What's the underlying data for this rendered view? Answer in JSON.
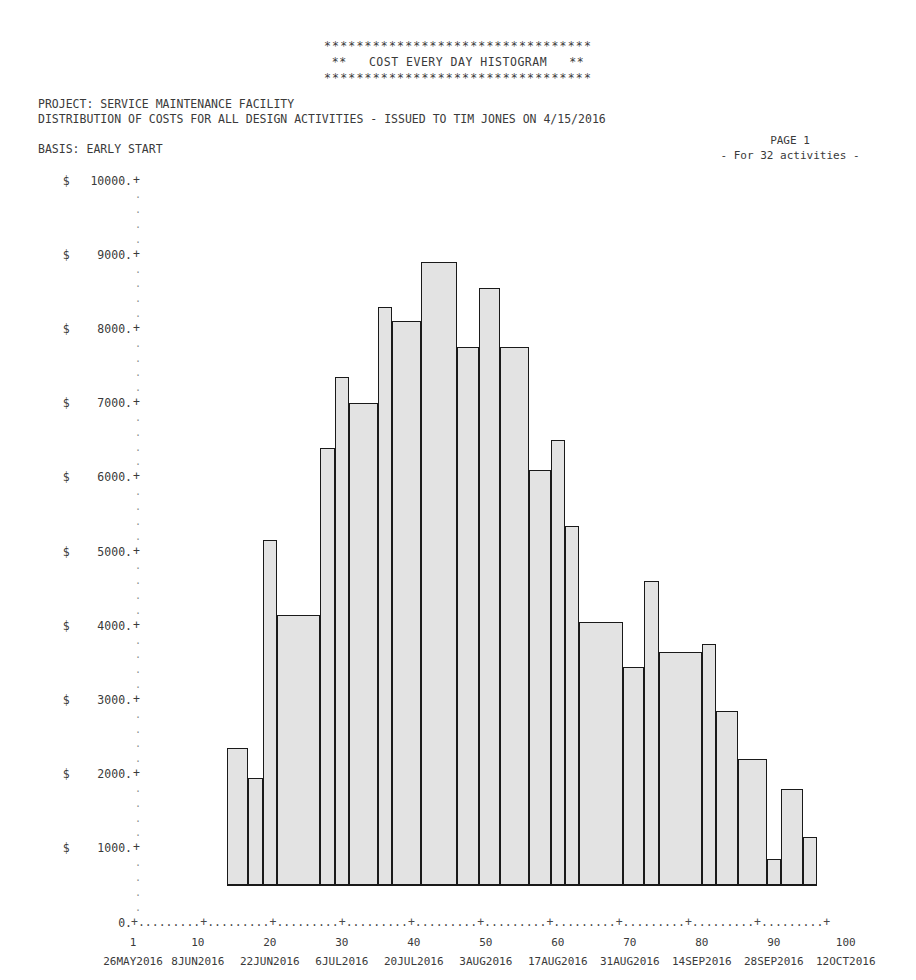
{
  "banner": {
    "stars_top": "*********************************",
    "title": "**   COST EVERY DAY HISTOGRAM   **",
    "stars_bottom": "*********************************"
  },
  "header": {
    "project_line": "PROJECT: SERVICE MAINTENANCE FACILITY",
    "distribution_line": "DISTRIBUTION OF COSTS FOR ALL DESIGN ACTIVITIES - ISSUED TO TIM JONES ON 4/15/2016",
    "basis_line": "BASIS: EARLY START",
    "page_label": "PAGE 1",
    "activities_label": "- For 32 activities -"
  },
  "axis": {
    "currency_symbol": "$",
    "y_ticks": [
      "10000.",
      "9000.",
      "8000.",
      "7000.",
      "6000.",
      "5000.",
      "4000.",
      "3000.",
      "2000.",
      "1000."
    ],
    "y_zero": "0.",
    "tick_glyph": "+",
    "minor_glyph": ".",
    "x_axis_rule": "+.........+.........+.........+.........+.........+.........+.........+.........+.........+.........+",
    "x_numbers": [
      "1",
      "10",
      "20",
      "30",
      "40",
      "50",
      "60",
      "70",
      "80",
      "90",
      "100"
    ],
    "x_dates": [
      "26MAY2016",
      "8JUN2016",
      "22JUN2016",
      "6JUL2016",
      "20JUL2016",
      "3AUG2016",
      "17AUG2016",
      "31AUG2016",
      "14SEP2016",
      "28SEP2016",
      "12OCT2016"
    ]
  },
  "colors": {
    "bar_fill": "#e3e3e3",
    "bar_stroke": "#1a1a1a",
    "text": "#3a3a3a"
  },
  "chart_data": {
    "type": "bar",
    "title": "COST EVERY DAY HISTOGRAM",
    "subtitle": "DISTRIBUTION OF COSTS FOR ALL DESIGN ACTIVITIES - ISSUED TO TIM JONES ON 4/15/2016",
    "xlabel": "",
    "ylabel": "$",
    "ylim": [
      0,
      10000
    ],
    "xlim": [
      1,
      101
    ],
    "grid": false,
    "legend": null,
    "ytick_values": [
      0,
      1000,
      2000,
      3000,
      4000,
      5000,
      6000,
      7000,
      8000,
      9000,
      10000
    ],
    "xtick_values": [
      1,
      10,
      20,
      30,
      40,
      50,
      60,
      70,
      80,
      90,
      100
    ],
    "xtick_dates": [
      "26MAY2016",
      "8JUN2016",
      "22JUN2016",
      "6JUL2016",
      "20JUL2016",
      "3AUG2016",
      "17AUG2016",
      "31AUG2016",
      "14SEP2016",
      "28SEP2016",
      "12OCT2016"
    ],
    "note": "Each bar spans a range of days; value is the daily cost in dollars.",
    "bars": [
      {
        "x_start": 14,
        "x_end": 17,
        "value": 2350
      },
      {
        "x_start": 17,
        "x_end": 19,
        "value": 1950
      },
      {
        "x_start": 19,
        "x_end": 21,
        "value": 5150
      },
      {
        "x_start": 21,
        "x_end": 27,
        "value": 4150
      },
      {
        "x_start": 27,
        "x_end": 29,
        "value": 6400
      },
      {
        "x_start": 29,
        "x_end": 31,
        "value": 7350
      },
      {
        "x_start": 31,
        "x_end": 35,
        "value": 7000
      },
      {
        "x_start": 35,
        "x_end": 37,
        "value": 8300
      },
      {
        "x_start": 37,
        "x_end": 41,
        "value": 8100
      },
      {
        "x_start": 41,
        "x_end": 46,
        "value": 8900
      },
      {
        "x_start": 46,
        "x_end": 49,
        "value": 7750
      },
      {
        "x_start": 49,
        "x_end": 52,
        "value": 8550
      },
      {
        "x_start": 52,
        "x_end": 56,
        "value": 7750
      },
      {
        "x_start": 56,
        "x_end": 59,
        "value": 6100
      },
      {
        "x_start": 59,
        "x_end": 61,
        "value": 6500
      },
      {
        "x_start": 61,
        "x_end": 63,
        "value": 5350
      },
      {
        "x_start": 63,
        "x_end": 69,
        "value": 4050
      },
      {
        "x_start": 69,
        "x_end": 72,
        "value": 3450
      },
      {
        "x_start": 72,
        "x_end": 74,
        "value": 4600
      },
      {
        "x_start": 74,
        "x_end": 80,
        "value": 3650
      },
      {
        "x_start": 80,
        "x_end": 82,
        "value": 3750
      },
      {
        "x_start": 82,
        "x_end": 85,
        "value": 2850
      },
      {
        "x_start": 85,
        "x_end": 89,
        "value": 2200
      },
      {
        "x_start": 89,
        "x_end": 91,
        "value": 850
      },
      {
        "x_start": 91,
        "x_end": 94,
        "value": 1800
      },
      {
        "x_start": 94,
        "x_end": 96,
        "value": 1150
      }
    ]
  }
}
